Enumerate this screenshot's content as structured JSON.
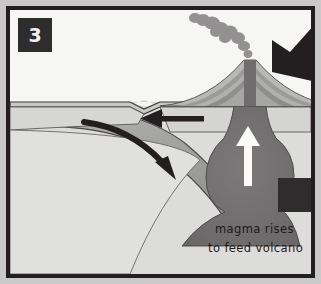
{
  "panel": {
    "number": "3",
    "number_box_color": "#2e2c2d",
    "number_text_color": "#f0f0ee",
    "border_color": "#231f20",
    "outer_background": "#c9c9c9"
  },
  "diagram": {
    "type": "subduction-zone-volcanism",
    "sky_color": "#f6f6f4",
    "crust_color": "#d2d2d0",
    "mantle_color": "#dcdcda",
    "slab_color": "#9a9a98",
    "magma_color": "#6f6d6e",
    "outline_color": "#3a3738",
    "smoke_color": "#8a8889",
    "arrow_color": "#231f20",
    "white_arrow_color": "#fbfbf9"
  },
  "labels": {
    "magma_line1": "magma rises",
    "magma_line2": "to feed volcano"
  },
  "icons": {
    "plate_motion_arrow": "left-arrow-icon",
    "subduction_arrow": "curved-down-arrow-icon",
    "magma_rise_arrow": "up-arrow-icon",
    "external_pressure_arrow": "large-diagonal-arrow-icon",
    "volcano": "volcano-icon",
    "smoke_plume": "smoke-plume-icon"
  }
}
